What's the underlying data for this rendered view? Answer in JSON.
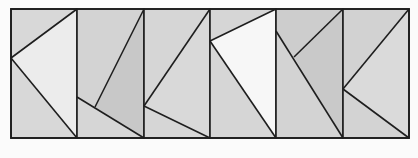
{
  "figure": {
    "colors": {
      "background": "#fbfbfb",
      "base_fill": "#d6d6d6",
      "stroke": "#1e1e1e",
      "light_fill": "#ececec",
      "lighter_fill": "#f7f7f7",
      "dark_fill": "#c9c9c9"
    },
    "frame": {
      "x": 11,
      "y": 9,
      "width": 398,
      "height": 129
    },
    "panels": [
      {
        "id": "panel-1",
        "x0": 11,
        "x1": 77,
        "regions": [
          {
            "name": "top-left",
            "points": "11,9 77,9 11,58",
            "fill": "#d8d8d8"
          },
          {
            "name": "center-triangle",
            "points": "11,58 77,9 77,138",
            "fill": "#ececec"
          },
          {
            "name": "bottom-left",
            "points": "11,58 77,138 11,138",
            "fill": "#d8d8d8"
          }
        ],
        "lines": [
          [
            11,
            58,
            77,
            9
          ],
          [
            11,
            58,
            77,
            138
          ]
        ]
      },
      {
        "id": "panel-2",
        "x0": 77,
        "x1": 144,
        "regions": [
          {
            "name": "left",
            "points": "77,9 144,9 95,107 77,97",
            "fill": "#d3d3d3"
          },
          {
            "name": "right-quad",
            "points": "144,9 144,138 95,107",
            "fill": "#c8c8c8"
          },
          {
            "name": "bottom",
            "points": "77,97 144,138 77,138",
            "fill": "#d6d6d6"
          }
        ],
        "lines": [
          [
            77,
            97,
            144,
            138
          ],
          [
            95,
            107,
            144,
            9
          ]
        ]
      },
      {
        "id": "panel-3",
        "x0": 144,
        "x1": 210,
        "regions": [
          {
            "name": "top-left",
            "points": "144,9 210,9 144,106",
            "fill": "#d6d6d6"
          },
          {
            "name": "right-triangle",
            "points": "144,106 210,9 210,138",
            "fill": "#d9d9d9"
          },
          {
            "name": "bottom-left",
            "points": "144,106 210,138 144,138",
            "fill": "#d6d6d6"
          }
        ],
        "lines": [
          [
            144,
            106,
            210,
            9
          ],
          [
            144,
            106,
            210,
            138
          ]
        ]
      },
      {
        "id": "panel-4",
        "x0": 210,
        "x1": 276,
        "regions": [
          {
            "name": "top-left",
            "points": "210,9 276,9 210,41",
            "fill": "#d6d6d6"
          },
          {
            "name": "center-triangle",
            "points": "210,41 276,9 276,138",
            "fill": "#f7f7f7"
          },
          {
            "name": "bottom-left",
            "points": "210,41 276,138 210,138",
            "fill": "#d6d6d6"
          }
        ],
        "lines": [
          [
            210,
            41,
            276,
            9
          ],
          [
            210,
            41,
            276,
            138
          ]
        ]
      },
      {
        "id": "panel-5",
        "x0": 276,
        "x1": 343,
        "regions": [
          {
            "name": "top",
            "points": "276,9 343,9 294,57 276,31",
            "fill": "#cdcdcd"
          },
          {
            "name": "right",
            "points": "343,9 343,138 294,57",
            "fill": "#c9c9c9"
          },
          {
            "name": "bottom-left",
            "points": "276,31 343,138 276,138",
            "fill": "#d3d3d3"
          }
        ],
        "lines": [
          [
            276,
            31,
            343,
            138
          ],
          [
            294,
            57,
            343,
            9
          ]
        ]
      },
      {
        "id": "panel-6",
        "x0": 343,
        "x1": 409,
        "regions": [
          {
            "name": "top-left",
            "points": "343,9 409,9 343,89",
            "fill": "#d2d2d2"
          },
          {
            "name": "right-triangle",
            "points": "343,89 409,9 409,138",
            "fill": "#dadada"
          },
          {
            "name": "bottom-left",
            "points": "343,89 409,138 343,138",
            "fill": "#d3d3d3"
          }
        ],
        "lines": [
          [
            343,
            89,
            409,
            9
          ],
          [
            343,
            89,
            409,
            138
          ]
        ]
      }
    ]
  }
}
